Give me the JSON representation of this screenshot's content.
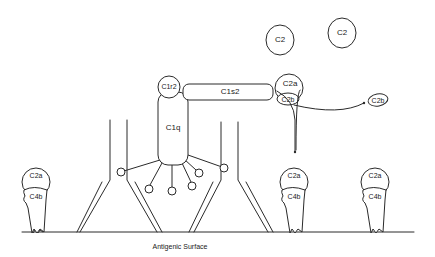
{
  "diagram": {
    "caption": "Antigenic Surface",
    "free_components": [
      {
        "label": "C2"
      },
      {
        "label": "C2"
      }
    ],
    "c1_complex": {
      "c1q": "C1q",
      "c1r2": "C1r2",
      "c1s2": "C1s2"
    },
    "cleaving_c2": {
      "c2a": "C2a",
      "c2b": "C2b"
    },
    "released_fragment": {
      "label": "C2b"
    },
    "c3_convertases": [
      {
        "upper": "C2a",
        "lower": "C4b"
      },
      {
        "upper": "C2a",
        "lower": "C4b"
      },
      {
        "upper": "C2a",
        "lower": "C4b"
      }
    ],
    "colors": {
      "line": "#2a2a2a",
      "background": "#ffffff",
      "text": "#1a1a1a"
    }
  }
}
